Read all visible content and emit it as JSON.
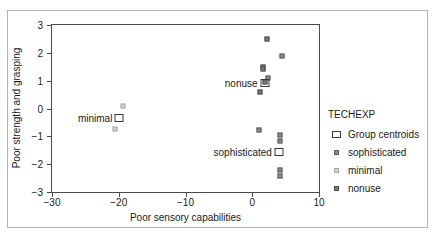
{
  "chart_data": {
    "type": "scatter",
    "title": "",
    "xlabel": "Poor sensory capabilities",
    "ylabel": "Poor strength and grasping",
    "xlim": [
      -30,
      10
    ],
    "ylim": [
      -3,
      3
    ],
    "xticks": [
      -30,
      -20,
      -10,
      0,
      10
    ],
    "yticks": [
      3,
      2,
      1,
      0,
      -1,
      -2,
      -3
    ],
    "xticklabels": [
      "−30",
      "−20",
      "−10",
      "0",
      "10"
    ],
    "yticklabels": [
      "3",
      "2",
      "1",
      "0",
      "−1",
      "−2",
      "−3"
    ],
    "grid": false,
    "legend": {
      "title": "TECHEXP",
      "position": "right",
      "entries": [
        {
          "label": "Group centroids",
          "marker": "open-square",
          "color": "#3a3a3a"
        },
        {
          "label": "sophisticated",
          "marker": "filled-square",
          "color": "#8a8a8a"
        },
        {
          "label": "minimal",
          "marker": "filled-square",
          "color": "#d2d2d2"
        },
        {
          "label": "nonuse",
          "marker": "filled-square",
          "color": "#7a7a7a"
        }
      ]
    },
    "series": [
      {
        "name": "sophisticated",
        "color": "#8a8a8a",
        "points": [
          {
            "x": 1.0,
            "y": -0.78
          },
          {
            "x": 4.1,
            "y": -0.95
          },
          {
            "x": 4.1,
            "y": -1.15
          },
          {
            "x": 4.1,
            "y": -2.22
          },
          {
            "x": 4.1,
            "y": -2.42
          },
          {
            "x": 2.3,
            "y": 1.1
          },
          {
            "x": 4.5,
            "y": 1.9
          }
        ]
      },
      {
        "name": "minimal",
        "color": "#d2d2d2",
        "points": [
          {
            "x": -19.4,
            "y": 0.1
          },
          {
            "x": -20.6,
            "y": -0.75
          }
        ]
      },
      {
        "name": "nonuse",
        "color": "#7a7a7a",
        "points": [
          {
            "x": 2.2,
            "y": 2.5
          },
          {
            "x": 1.6,
            "y": 1.5
          },
          {
            "x": 1.6,
            "y": 1.42
          },
          {
            "x": 1.9,
            "y": 0.95
          },
          {
            "x": 1.2,
            "y": 0.6
          }
        ]
      }
    ],
    "centroids": [
      {
        "name": "nonuse",
        "label": "nonuse",
        "x": 1.85,
        "y": 0.93
      },
      {
        "name": "minimal",
        "label": "minimal",
        "x": -19.9,
        "y": -0.33
      },
      {
        "name": "sophisticated",
        "label": "sophisticated",
        "x": 4.0,
        "y": -1.55
      }
    ]
  }
}
